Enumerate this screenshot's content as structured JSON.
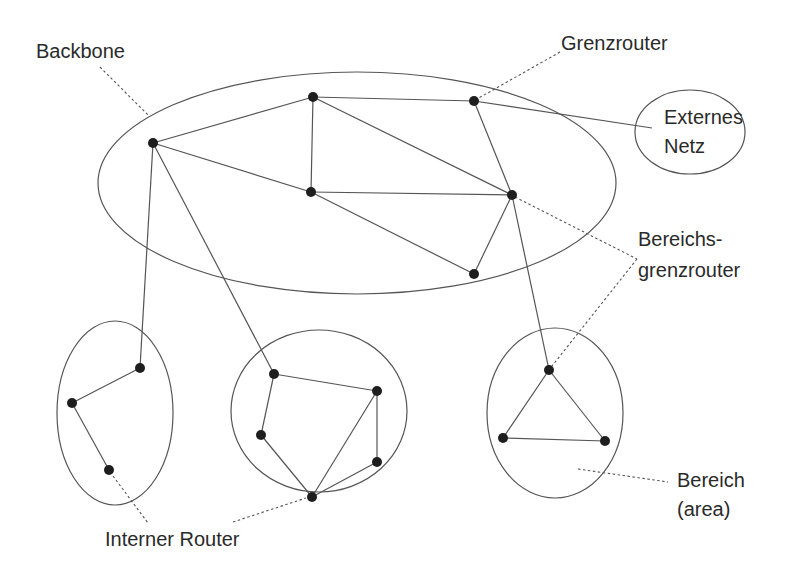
{
  "labels": {
    "backbone": "Backbone",
    "grenzrouter": "Grenzrouter",
    "externes_netz_1": "Externes",
    "externes_netz_2": "Netz",
    "bereichsgrenzrouter_1": "Bereichs-",
    "bereichsgrenzrouter_2": "grenzrouter",
    "bereich_1": "Bereich",
    "bereich_2": "(area)",
    "interner_router": "Interner Router"
  },
  "colors": {
    "line": "#555555",
    "node": "#1e1e1e",
    "text": "#2a2a2a",
    "background": "#ffffff"
  },
  "regions": [
    {
      "id": "backbone",
      "cx": 357,
      "cy": 183,
      "rx": 259,
      "ry": 111
    },
    {
      "id": "externes-netz",
      "cx": 690,
      "cy": 132,
      "rx": 55,
      "ry": 42
    },
    {
      "id": "area-left",
      "cx": 115,
      "cy": 413,
      "rx": 58,
      "ry": 92
    },
    {
      "id": "area-middle",
      "cx": 319,
      "cy": 411,
      "rx": 88,
      "ry": 81
    },
    {
      "id": "area-right",
      "cx": 555,
      "cy": 413,
      "rx": 68,
      "ry": 85
    }
  ],
  "nodes": [
    {
      "id": "bb1",
      "x": 153,
      "y": 143
    },
    {
      "id": "bb2",
      "x": 313,
      "y": 97
    },
    {
      "id": "bb3",
      "x": 311,
      "y": 192
    },
    {
      "id": "grenzrouter",
      "x": 474,
      "y": 101
    },
    {
      "id": "bb-abr",
      "x": 512,
      "y": 195
    },
    {
      "id": "bb5",
      "x": 474,
      "y": 274
    },
    {
      "id": "l1",
      "x": 140,
      "y": 368
    },
    {
      "id": "l2",
      "x": 72,
      "y": 403
    },
    {
      "id": "l3",
      "x": 109,
      "y": 470
    },
    {
      "id": "m1",
      "x": 274,
      "y": 374
    },
    {
      "id": "m2",
      "x": 377,
      "y": 391
    },
    {
      "id": "m3",
      "x": 261,
      "y": 435
    },
    {
      "id": "m4",
      "x": 377,
      "y": 462
    },
    {
      "id": "m5",
      "x": 312,
      "y": 497
    },
    {
      "id": "r1",
      "x": 549,
      "y": 370
    },
    {
      "id": "r2",
      "x": 503,
      "y": 438
    },
    {
      "id": "r3",
      "x": 605,
      "y": 441
    }
  ],
  "edges": [
    [
      "bb1",
      "bb2"
    ],
    [
      "bb1",
      "bb3"
    ],
    [
      "bb2",
      "bb3"
    ],
    [
      "bb2",
      "grenzrouter"
    ],
    [
      "bb2",
      "bb-abr"
    ],
    [
      "bb3",
      "bb-abr"
    ],
    [
      "bb3",
      "bb5"
    ],
    [
      "grenzrouter",
      "bb-abr"
    ],
    [
      "bb-abr",
      "bb5"
    ],
    [
      "bb1",
      "l1"
    ],
    [
      "bb1",
      "m1"
    ],
    [
      "bb-abr",
      "r1"
    ],
    [
      "l1",
      "l2"
    ],
    [
      "l2",
      "l3"
    ],
    [
      "m1",
      "m2"
    ],
    [
      "m1",
      "m3"
    ],
    [
      "m2",
      "m4"
    ],
    [
      "m2",
      "m5"
    ],
    [
      "m3",
      "m5"
    ],
    [
      "m4",
      "m5"
    ],
    [
      "r1",
      "r2"
    ],
    [
      "r1",
      "r3"
    ],
    [
      "r2",
      "r3"
    ]
  ],
  "external_link": {
    "from": "grenzrouter",
    "x2": 652,
    "y2": 128
  },
  "callouts": [
    {
      "id": "backbone-callout",
      "x1": 100,
      "y1": 67,
      "x2": 149,
      "y2": 116
    },
    {
      "id": "grenzrouter-callout",
      "x1": 560,
      "y1": 52,
      "x2": 477,
      "y2": 99
    },
    {
      "id": "abr-callout-1",
      "x1": 515,
      "y1": 197,
      "x2": 637,
      "y2": 259
    },
    {
      "id": "abr-callout-2",
      "x1": 637,
      "y1": 259,
      "x2": 552,
      "y2": 366
    },
    {
      "id": "bereich-callout",
      "x1": 578,
      "y1": 469,
      "x2": 668,
      "y2": 482
    },
    {
      "id": "internal-callout-1",
      "x1": 113,
      "y1": 476,
      "x2": 148,
      "y2": 523
    },
    {
      "id": "internal-callout-2",
      "x1": 233,
      "y1": 522,
      "x2": 306,
      "y2": 498
    }
  ]
}
